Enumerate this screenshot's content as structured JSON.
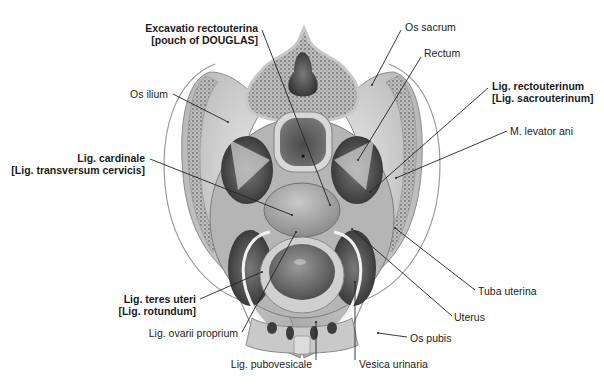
{
  "figure": {
    "colors": {
      "background": "#ffffff",
      "bone_cortex": "#d9d9d9",
      "bone_spongy": "#9a9a9a",
      "soft_tissue": "#bdbdbd",
      "dark_cavity": "#3a3a3a",
      "leader_line": "#222222",
      "label_text": "#222222"
    }
  },
  "labels": [
    {
      "id": "excavatio",
      "lines": [
        "Excavatio rectouterina",
        "[pouch of DOUGLAS]"
      ],
      "bold": true,
      "x": 258,
      "y": 22,
      "align": "right",
      "leader": [
        262,
        30,
        330,
        205
      ]
    },
    {
      "id": "os-sacrum",
      "lines": [
        "Os sacrum"
      ],
      "bold": false,
      "x": 405,
      "y": 21,
      "align": "left",
      "leader": [
        401,
        30,
        372,
        85
      ]
    },
    {
      "id": "rectum",
      "lines": [
        "Rectum"
      ],
      "bold": false,
      "x": 424,
      "y": 47,
      "align": "left",
      "leader": [
        421,
        57,
        358,
        160
      ]
    },
    {
      "id": "lig-rectouterinum",
      "lines": [
        "Lig. rectouterinum",
        "[Lig. sacrouterinum]"
      ],
      "bold": true,
      "x": 492,
      "y": 80,
      "align": "left",
      "leader": [
        488,
        88,
        370,
        192
      ]
    },
    {
      "id": "levator-ani",
      "lines": [
        "M. levator ani"
      ],
      "bold": false,
      "x": 510,
      "y": 125,
      "align": "left",
      "leader": [
        507,
        131,
        396,
        178
      ]
    },
    {
      "id": "os-ilium",
      "lines": [
        "Os ilium"
      ],
      "bold": false,
      "x": 168,
      "y": 88,
      "align": "right",
      "leader": [
        173,
        94,
        228,
        122
      ]
    },
    {
      "id": "lig-cardinale",
      "lines": [
        "Lig. cardinale",
        "[Lig. transversum cervicis]"
      ],
      "bold": true,
      "x": 145,
      "y": 152,
      "align": "right",
      "leader": [
        150,
        159,
        292,
        215
      ]
    },
    {
      "id": "lig-teres",
      "lines": [
        "Lig. teres uteri",
        "[Lig. rotundum]"
      ],
      "bold": true,
      "x": 196,
      "y": 293,
      "align": "right",
      "leader": [
        200,
        299,
        262,
        272
      ]
    },
    {
      "id": "lig-ovarii",
      "lines": [
        "Lig. ovarii proprium"
      ],
      "bold": false,
      "x": 238,
      "y": 327,
      "align": "right",
      "leader": [
        242,
        332,
        296,
        232
      ]
    },
    {
      "id": "lig-pubovesicale",
      "lines": [
        "Lig. pubovesicale"
      ],
      "bold": false,
      "x": 312,
      "y": 358,
      "align": "right",
      "leader": [
        316,
        360,
        316,
        322
      ]
    },
    {
      "id": "vesica",
      "lines": [
        "Vesica urinaria"
      ],
      "bold": false,
      "x": 359,
      "y": 358,
      "align": "left",
      "leader": [
        355,
        360,
        355,
        282
      ]
    },
    {
      "id": "tuba",
      "lines": [
        "Tuba uterina"
      ],
      "bold": false,
      "x": 478,
      "y": 285,
      "align": "left",
      "leader": [
        475,
        290,
        395,
        228
      ]
    },
    {
      "id": "uterus",
      "lines": [
        "Uterus"
      ],
      "bold": false,
      "x": 454,
      "y": 311,
      "align": "left",
      "leader": [
        452,
        316,
        352,
        229
      ]
    },
    {
      "id": "os-pubis",
      "lines": [
        "Os pubis"
      ],
      "bold": false,
      "x": 410,
      "y": 332,
      "align": "left",
      "leader": [
        407,
        337,
        378,
        333
      ]
    }
  ]
}
